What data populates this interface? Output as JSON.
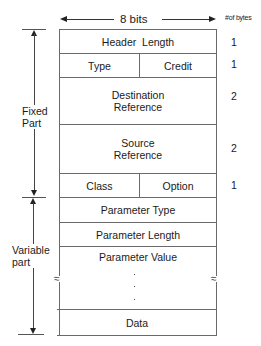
{
  "header": {
    "width_label": "8 bits",
    "bytes_column_label": "#of bytes"
  },
  "side_labels": {
    "fixed_part": [
      "Fixed",
      "Part"
    ],
    "variable_part": [
      "Variable",
      "part"
    ]
  },
  "fields": {
    "header_length": {
      "label": "Header  Length",
      "bytes": "1"
    },
    "type": {
      "label": "Type"
    },
    "credit": {
      "label": "Credit"
    },
    "type_credit_bytes": "1",
    "destination_reference": {
      "label": [
        "Destination",
        "Reference"
      ],
      "bytes": "2"
    },
    "source_reference": {
      "label": [
        "Source",
        "Reference"
      ],
      "bytes": "2"
    },
    "class": {
      "label": "Class"
    },
    "option": {
      "label": "Option"
    },
    "class_option_bytes": "1",
    "parameter_type": {
      "label": "Parameter Type"
    },
    "parameter_length": {
      "label": "Parameter Length"
    },
    "parameter_value": {
      "label": "Parameter Value",
      "continuation": "·"
    },
    "data": {
      "label": "Data"
    }
  },
  "icons": {
    "break_mark": "≈"
  }
}
